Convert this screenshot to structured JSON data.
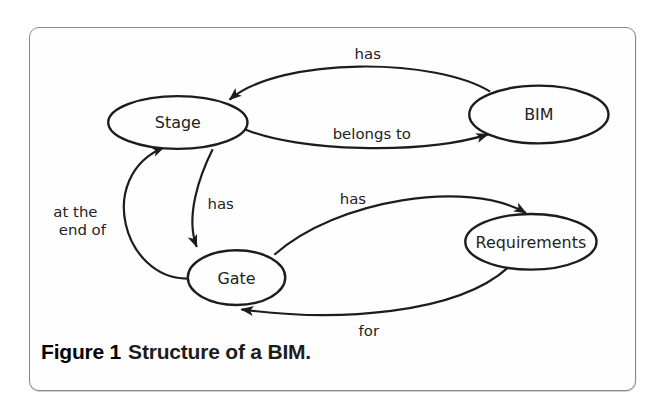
{
  "figure": {
    "caption_label": "Figure 1",
    "caption_text": "Structure of a BIM."
  },
  "diagram": {
    "nodes": [
      {
        "id": "stage",
        "label": "Stage"
      },
      {
        "id": "bim",
        "label": "BIM"
      },
      {
        "id": "gate",
        "label": "Gate"
      },
      {
        "id": "requirements",
        "label": "Requirements"
      }
    ],
    "edges": [
      {
        "from": "bim",
        "to": "stage",
        "label": "has"
      },
      {
        "from": "stage",
        "to": "bim",
        "label": "belongs to"
      },
      {
        "from": "stage",
        "to": "gate",
        "label": "has"
      },
      {
        "from": "gate",
        "to": "stage",
        "label": "at the end of",
        "label_lines": [
          "at the",
          "end of"
        ]
      },
      {
        "from": "gate",
        "to": "requirements",
        "label": "has"
      },
      {
        "from": "requirements",
        "to": "gate",
        "label": "for"
      }
    ]
  },
  "colors": {
    "ink": "#1c1c1c",
    "card_border": "#8a8a8a",
    "background": "#ffffff"
  }
}
